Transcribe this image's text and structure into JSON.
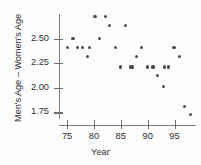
{
  "chart_data": {
    "type": "scatter",
    "title": "",
    "xlabel": "Year",
    "ylabel": "Men's Age – Women's Age",
    "xlim": [
      73.5,
      99
    ],
    "ylim": [
      1.68,
      2.75
    ],
    "xticks": [
      75,
      80,
      85,
      90,
      95
    ],
    "yticks": [
      2.5,
      2.25,
      2.0,
      1.75
    ],
    "ytick_labels": [
      "2.50",
      "2.25",
      "2.00",
      "1.75"
    ],
    "xtick_labels": [
      "75",
      "80",
      "85",
      "90",
      "95"
    ],
    "grid": false,
    "legend": null,
    "marker": "filled-circle",
    "marker_color": "#4c4c50",
    "axis_color": "#7d7d7d",
    "x": [
      75.0,
      76.1,
      76.9,
      77.9,
      78.8,
      80.2,
      81.1,
      82.1,
      82.9,
      84.1,
      85.0,
      85.9,
      86.9,
      88.0,
      88.9,
      90.0,
      90.9,
      91.9,
      92.9,
      93.9,
      94.9,
      95.9,
      96.9,
      97.9,
      79.1,
      87.1,
      91.1,
      93.1
    ],
    "y": [
      2.41,
      2.5,
      2.41,
      2.41,
      2.32,
      2.72,
      2.5,
      2.72,
      2.63,
      2.41,
      2.21,
      2.63,
      2.21,
      2.32,
      2.41,
      2.21,
      2.21,
      2.12,
      2.01,
      2.21,
      2.41,
      2.32,
      1.81,
      1.73,
      2.41,
      2.21,
      2.21,
      2.21
    ],
    "points": [
      {
        "year": 75.0,
        "value": 2.41
      },
      {
        "year": 76.1,
        "value": 2.5
      },
      {
        "year": 76.9,
        "value": 2.41
      },
      {
        "year": 77.9,
        "value": 2.41
      },
      {
        "year": 78.8,
        "value": 2.32
      },
      {
        "year": 79.1,
        "value": 2.41
      },
      {
        "year": 80.2,
        "value": 2.72
      },
      {
        "year": 81.1,
        "value": 2.5
      },
      {
        "year": 82.1,
        "value": 2.72
      },
      {
        "year": 82.9,
        "value": 2.63
      },
      {
        "year": 84.1,
        "value": 2.41
      },
      {
        "year": 85.0,
        "value": 2.21
      },
      {
        "year": 85.9,
        "value": 2.63
      },
      {
        "year": 86.9,
        "value": 2.21
      },
      {
        "year": 87.1,
        "value": 2.21
      },
      {
        "year": 88.0,
        "value": 2.32
      },
      {
        "year": 88.9,
        "value": 2.41
      },
      {
        "year": 90.0,
        "value": 2.21
      },
      {
        "year": 90.9,
        "value": 2.21
      },
      {
        "year": 91.1,
        "value": 2.21
      },
      {
        "year": 91.9,
        "value": 2.12
      },
      {
        "year": 92.9,
        "value": 2.01
      },
      {
        "year": 93.1,
        "value": 2.21
      },
      {
        "year": 93.9,
        "value": 2.21
      },
      {
        "year": 94.9,
        "value": 2.41
      },
      {
        "year": 95.9,
        "value": 2.32
      },
      {
        "year": 96.9,
        "value": 1.81
      },
      {
        "year": 97.9,
        "value": 1.73
      }
    ]
  }
}
